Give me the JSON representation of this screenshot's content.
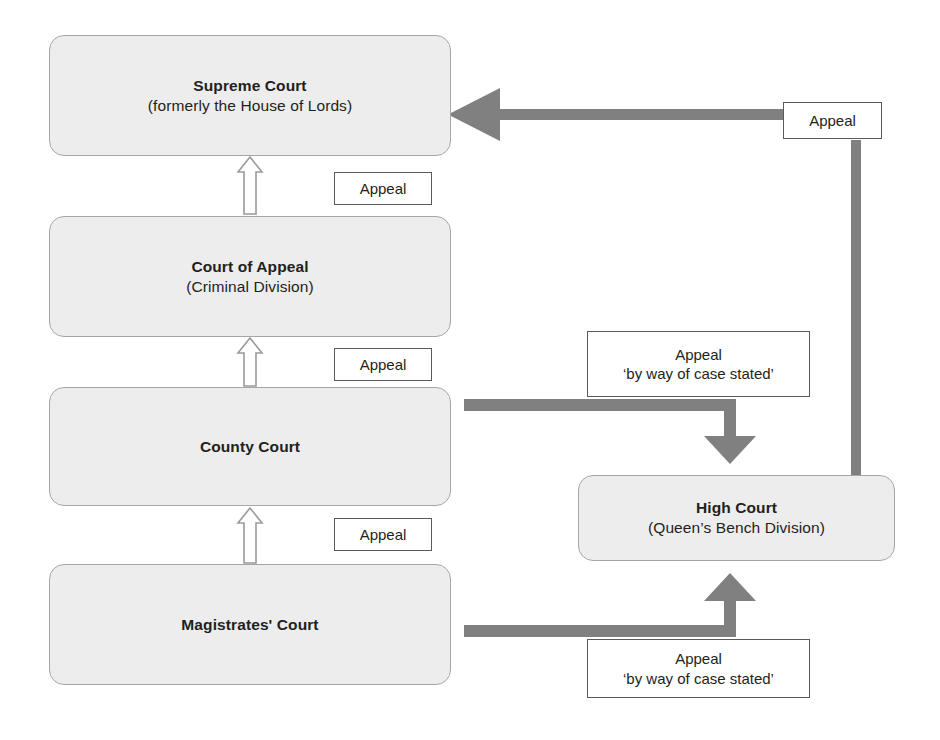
{
  "diagram": {
    "colors": {
      "box_fill": "#ededed",
      "box_border": "#a6a6a6",
      "thick_arrow": "#808080",
      "outline_arrow_stroke": "#9a9a9a",
      "label_border": "#595959",
      "text": "#231f20",
      "background": "#ffffff"
    },
    "courts": [
      {
        "id": "supreme-court",
        "title": "Supreme Court",
        "subtitle": "(formerly the House of Lords)"
      },
      {
        "id": "court-of-appeal",
        "title": "Court of Appeal",
        "subtitle": "(Criminal Division)"
      },
      {
        "id": "county-court",
        "title": "County Court",
        "subtitle": ""
      },
      {
        "id": "magistrates-court",
        "title": "Magistrates' Court",
        "subtitle": ""
      },
      {
        "id": "high-court",
        "title": "High Court",
        "subtitle": "(Queen’s Bench Division)"
      }
    ],
    "labels": [
      {
        "id": "appeal-coa-to-sc",
        "line1": "Appeal",
        "line2": ""
      },
      {
        "id": "appeal-county-to-coa",
        "line1": "Appeal",
        "line2": ""
      },
      {
        "id": "appeal-magistrates-to-county",
        "line1": "Appeal",
        "line2": ""
      },
      {
        "id": "appeal-high-to-supreme",
        "line1": "Appeal",
        "line2": ""
      },
      {
        "id": "appeal-county-case-stated",
        "line1": "Appeal",
        "line2": "‘by way of case stated’"
      },
      {
        "id": "appeal-magistrates-case-stated",
        "line1": "Appeal",
        "line2": "‘by way of case stated’"
      }
    ],
    "connectors": [
      {
        "id": "magistrates-to-county",
        "from": "magistrates-court",
        "to": "county-court",
        "style": "outline-arrow-up",
        "label": "Appeal"
      },
      {
        "id": "county-to-court-of-appeal",
        "from": "county-court",
        "to": "court-of-appeal",
        "style": "outline-arrow-up",
        "label": "Appeal"
      },
      {
        "id": "court-of-appeal-to-supreme",
        "from": "court-of-appeal",
        "to": "supreme-court",
        "style": "outline-arrow-up",
        "label": "Appeal"
      },
      {
        "id": "county-to-high-court",
        "from": "county-court",
        "to": "high-court",
        "style": "thick-arrow-elbow-down",
        "label": "Appeal ‘by way of case stated’"
      },
      {
        "id": "magistrates-to-high-court",
        "from": "magistrates-court",
        "to": "high-court",
        "style": "thick-arrow-elbow-up",
        "label": "Appeal ‘by way of case stated’"
      },
      {
        "id": "high-court-to-supreme",
        "from": "high-court",
        "to": "supreme-court",
        "style": "thick-arrow-elbow-left",
        "label": "Appeal"
      }
    ]
  }
}
